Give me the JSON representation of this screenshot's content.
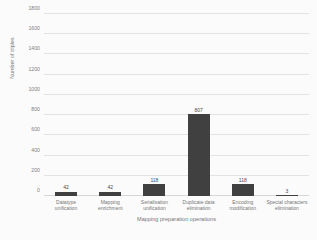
{
  "chart_data": {
    "type": "bar",
    "title": "",
    "xlabel": "Mapping preparation operations",
    "ylabel": "Number of triples",
    "categories": [
      "Datatype unification",
      "Mapping enrichment",
      "Serialisation unification",
      "Duplicate data elimination",
      "Encoding modification",
      "Special characters elimination"
    ],
    "values": [
      42,
      42,
      118,
      807,
      118,
      3
    ],
    "value_labels": [
      "42",
      "42",
      "118",
      "807",
      "118",
      "3"
    ],
    "ylim": [
      0,
      1800
    ],
    "yticks": [
      0,
      200,
      400,
      600,
      800,
      1000,
      1200,
      1400,
      1600,
      1800
    ],
    "ytick_labels": [
      "0",
      "200",
      "400",
      "600",
      "800",
      "1000",
      "1200",
      "1400",
      "1600",
      "1800"
    ],
    "grid": "horizontal",
    "legend": "none",
    "bar_color": "#404040",
    "gridline_color": "#e3e3e3",
    "background_color": "#fbfbfb"
  }
}
